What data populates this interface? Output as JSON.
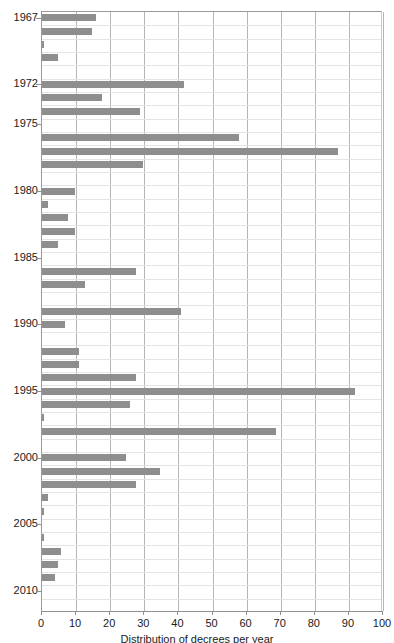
{
  "chart_data": {
    "type": "bar",
    "orientation": "horizontal",
    "title": "",
    "xlabel": "Distribution of decrees per year",
    "ylabel": "",
    "xlim": [
      0,
      100
    ],
    "ylim_years": [
      1967,
      2011
    ],
    "grid": true,
    "legend": null,
    "bar_color": "#8e8e8e",
    "grid_color": "#b5b5b5",
    "axis_color": "#8f8f8f",
    "xticks": [
      0,
      10,
      20,
      30,
      40,
      50,
      60,
      70,
      80,
      90,
      100
    ],
    "xtick_labels": [
      "0",
      "10",
      "20",
      "30",
      "40",
      "50",
      "60",
      "70",
      "80",
      "90",
      "100"
    ],
    "ytick_labels": [
      "1967",
      "1972",
      "1975",
      "1980",
      "1985",
      "1990",
      "1995",
      "2000",
      "2005",
      "2010"
    ],
    "categories": [
      "1967",
      "1968",
      "1969",
      "1970",
      "1971",
      "1972",
      "1973",
      "1974",
      "1975",
      "1976",
      "1977",
      "1978",
      "1979",
      "1980",
      "1981",
      "1982",
      "1983",
      "1984",
      "1985",
      "1986",
      "1987",
      "1988",
      "1989",
      "1990",
      "1991",
      "1992",
      "1993",
      "1994",
      "1995",
      "1996",
      "1997",
      "1998",
      "1999",
      "2000",
      "2001",
      "2002",
      "2003",
      "2004",
      "2005",
      "2006",
      "2007",
      "2008",
      "2009",
      "2010",
      "2011"
    ],
    "values": [
      16,
      15,
      1,
      5,
      0,
      42,
      18,
      29,
      0,
      58,
      87,
      30,
      0,
      10,
      2,
      8,
      10,
      5,
      0,
      28,
      13,
      0,
      41,
      7,
      0,
      11,
      11,
      28,
      92,
      26,
      1,
      69,
      0,
      25,
      35,
      28,
      2,
      1,
      0,
      1,
      6,
      5,
      4,
      0,
      0
    ],
    "series_note": "one bar per calendar year, 1967 at top through 2011 at bottom"
  }
}
